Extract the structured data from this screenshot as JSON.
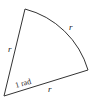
{
  "diagram": {
    "labels": {
      "left_radius": "r",
      "bottom_radius": "r",
      "arc": "r",
      "angle": "1 rad"
    },
    "colors": {
      "stroke": "#333333",
      "background": "#ffffff"
    }
  }
}
